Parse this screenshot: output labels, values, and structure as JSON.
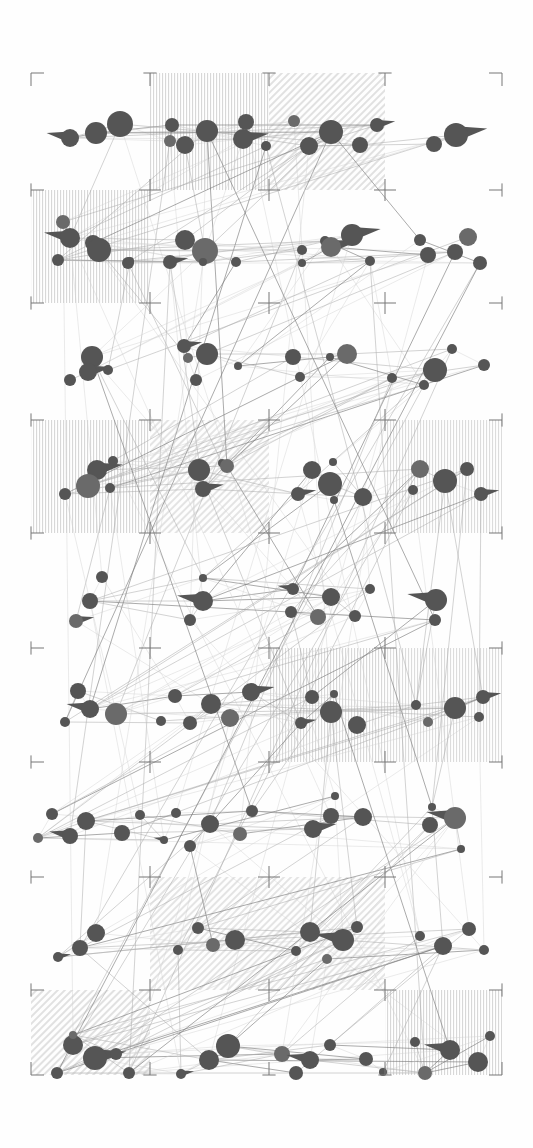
{
  "figure": {
    "kind": "node-link-diagram",
    "width": 533,
    "height": 1148,
    "background_color": "#fefefe"
  },
  "palette": {
    "node_fill": "#555555",
    "node_fill_light": "#6a6a6a",
    "edge_light": "#cfcfcf",
    "edge_mid": "#a8a8a8",
    "edge_dark": "#7a7a7a",
    "hatch_color": "#b9b9b9",
    "registration_color": "#777777",
    "paper": "#fefefe"
  },
  "registration_grid": {
    "label": "registration-marks",
    "columns_x": [
      31,
      150,
      269,
      385,
      502
    ],
    "rows_y": [
      73,
      190,
      303,
      420,
      533,
      648,
      762,
      877,
      990,
      1075
    ],
    "corner_arm_length": 13,
    "plus_arm_length": 11,
    "stroke_width": 1
  },
  "hatch_blocks": [
    {
      "name": "block-r0-c1",
      "x": 150,
      "y": 73,
      "w": 119,
      "h": 117,
      "pattern": "vertical",
      "opacity": 0.55
    },
    {
      "name": "block-r0-c2",
      "x": 269,
      "y": 73,
      "w": 116,
      "h": 117,
      "pattern": "diagonal",
      "opacity": 0.45
    },
    {
      "name": "block-r1-c0",
      "x": 31,
      "y": 190,
      "w": 119,
      "h": 113,
      "pattern": "vertical",
      "opacity": 0.55
    },
    {
      "name": "block-r3-c0",
      "x": 31,
      "y": 420,
      "w": 119,
      "h": 113,
      "pattern": "vertical",
      "opacity": 0.55
    },
    {
      "name": "block-r3-c1",
      "x": 150,
      "y": 420,
      "w": 119,
      "h": 113,
      "pattern": "diagonal",
      "opacity": 0.4
    },
    {
      "name": "block-r3-c3",
      "x": 385,
      "y": 420,
      "w": 117,
      "h": 113,
      "pattern": "vertical",
      "opacity": 0.5
    },
    {
      "name": "block-r5-c2",
      "x": 269,
      "y": 648,
      "w": 116,
      "h": 114,
      "pattern": "vertical",
      "opacity": 0.55
    },
    {
      "name": "block-r5-c3",
      "x": 385,
      "y": 648,
      "w": 117,
      "h": 114,
      "pattern": "vertical",
      "opacity": 0.5
    },
    {
      "name": "block-r7-c1",
      "x": 150,
      "y": 877,
      "w": 119,
      "h": 113,
      "pattern": "diagonal",
      "opacity": 0.4
    },
    {
      "name": "block-r7-c2",
      "x": 269,
      "y": 877,
      "w": 116,
      "h": 113,
      "pattern": "diagonal",
      "opacity": 0.4
    },
    {
      "name": "block-r8-c0",
      "x": 31,
      "y": 990,
      "w": 119,
      "h": 85,
      "pattern": "diagonal",
      "opacity": 0.45
    },
    {
      "name": "block-r8-c3",
      "x": 385,
      "y": 990,
      "w": 117,
      "h": 85,
      "pattern": "vertical",
      "opacity": 0.55
    }
  ],
  "chart_data": {
    "type": "scatter",
    "xlabel": "",
    "ylabel": "",
    "xlim": [
      0,
      533
    ],
    "ylim": [
      0,
      1148
    ],
    "grid": true,
    "legend": "none",
    "node_count": 176,
    "edge_count": 430,
    "bands_y": [
      130,
      248,
      365,
      482,
      598,
      712,
      828,
      938,
      1050
    ],
    "size_range_px": [
      3,
      13
    ],
    "nodes": [
      {
        "x": 70,
        "y": 138,
        "r": 9,
        "tail": true
      },
      {
        "x": 96,
        "y": 133,
        "r": 11,
        "tail": false
      },
      {
        "x": 120,
        "y": 124,
        "r": 13,
        "tail": false
      },
      {
        "x": 170,
        "y": 141,
        "r": 6,
        "tail": false
      },
      {
        "x": 172,
        "y": 125,
        "r": 7,
        "tail": false
      },
      {
        "x": 185,
        "y": 145,
        "r": 9,
        "tail": false
      },
      {
        "x": 207,
        "y": 131,
        "r": 11,
        "tail": false
      },
      {
        "x": 243,
        "y": 139,
        "r": 10,
        "tail": true
      },
      {
        "x": 246,
        "y": 122,
        "r": 8,
        "tail": false
      },
      {
        "x": 266,
        "y": 146,
        "r": 5,
        "tail": false
      },
      {
        "x": 294,
        "y": 121,
        "r": 6,
        "tail": false
      },
      {
        "x": 309,
        "y": 146,
        "r": 9,
        "tail": false
      },
      {
        "x": 331,
        "y": 132,
        "r": 12,
        "tail": false
      },
      {
        "x": 360,
        "y": 145,
        "r": 8,
        "tail": false
      },
      {
        "x": 377,
        "y": 125,
        "r": 7,
        "tail": true
      },
      {
        "x": 434,
        "y": 144,
        "r": 8,
        "tail": false
      },
      {
        "x": 456,
        "y": 135,
        "r": 12,
        "tail": true
      },
      {
        "x": 63,
        "y": 222,
        "r": 7,
        "tail": false
      },
      {
        "x": 70,
        "y": 238,
        "r": 10,
        "tail": true
      },
      {
        "x": 93,
        "y": 243,
        "r": 8,
        "tail": false
      },
      {
        "x": 99,
        "y": 250,
        "r": 12,
        "tail": false
      },
      {
        "x": 58,
        "y": 260,
        "r": 6,
        "tail": false
      },
      {
        "x": 128,
        "y": 263,
        "r": 6,
        "tail": false
      },
      {
        "x": 185,
        "y": 240,
        "r": 10,
        "tail": false
      },
      {
        "x": 205,
        "y": 251,
        "r": 13,
        "tail": false
      },
      {
        "x": 130,
        "y": 261,
        "r": 4,
        "tail": false
      },
      {
        "x": 170,
        "y": 262,
        "r": 7,
        "tail": true
      },
      {
        "x": 203,
        "y": 262,
        "r": 4,
        "tail": false
      },
      {
        "x": 236,
        "y": 262,
        "r": 5,
        "tail": false
      },
      {
        "x": 302,
        "y": 250,
        "r": 5,
        "tail": false
      },
      {
        "x": 325,
        "y": 241,
        "r": 5,
        "tail": false
      },
      {
        "x": 331,
        "y": 247,
        "r": 10,
        "tail": true
      },
      {
        "x": 352,
        "y": 235,
        "r": 11,
        "tail": true
      },
      {
        "x": 302,
        "y": 263,
        "r": 4,
        "tail": false
      },
      {
        "x": 370,
        "y": 261,
        "r": 5,
        "tail": false
      },
      {
        "x": 420,
        "y": 240,
        "r": 6,
        "tail": false
      },
      {
        "x": 428,
        "y": 255,
        "r": 8,
        "tail": false
      },
      {
        "x": 455,
        "y": 252,
        "r": 8,
        "tail": false
      },
      {
        "x": 468,
        "y": 237,
        "r": 9,
        "tail": false
      },
      {
        "x": 480,
        "y": 263,
        "r": 7,
        "tail": false
      },
      {
        "x": 92,
        "y": 357,
        "r": 11,
        "tail": false
      },
      {
        "x": 88,
        "y": 372,
        "r": 9,
        "tail": true
      },
      {
        "x": 70,
        "y": 380,
        "r": 6,
        "tail": false
      },
      {
        "x": 108,
        "y": 370,
        "r": 5,
        "tail": false
      },
      {
        "x": 184,
        "y": 346,
        "r": 7,
        "tail": true
      },
      {
        "x": 188,
        "y": 358,
        "r": 5,
        "tail": false
      },
      {
        "x": 207,
        "y": 354,
        "r": 11,
        "tail": false
      },
      {
        "x": 196,
        "y": 380,
        "r": 6,
        "tail": false
      },
      {
        "x": 238,
        "y": 366,
        "r": 4,
        "tail": false
      },
      {
        "x": 293,
        "y": 357,
        "r": 8,
        "tail": false
      },
      {
        "x": 300,
        "y": 377,
        "r": 5,
        "tail": false
      },
      {
        "x": 330,
        "y": 357,
        "r": 4,
        "tail": false
      },
      {
        "x": 347,
        "y": 354,
        "r": 10,
        "tail": false
      },
      {
        "x": 392,
        "y": 378,
        "r": 5,
        "tail": false
      },
      {
        "x": 435,
        "y": 370,
        "r": 12,
        "tail": false
      },
      {
        "x": 424,
        "y": 385,
        "r": 5,
        "tail": false
      },
      {
        "x": 452,
        "y": 349,
        "r": 5,
        "tail": false
      },
      {
        "x": 484,
        "y": 365,
        "r": 6,
        "tail": false
      },
      {
        "x": 97,
        "y": 470,
        "r": 10,
        "tail": true
      },
      {
        "x": 88,
        "y": 486,
        "r": 12,
        "tail": false
      },
      {
        "x": 65,
        "y": 494,
        "r": 6,
        "tail": false
      },
      {
        "x": 113,
        "y": 461,
        "r": 5,
        "tail": false
      },
      {
        "x": 110,
        "y": 488,
        "r": 5,
        "tail": false
      },
      {
        "x": 199,
        "y": 470,
        "r": 11,
        "tail": false
      },
      {
        "x": 203,
        "y": 489,
        "r": 8,
        "tail": true
      },
      {
        "x": 222,
        "y": 463,
        "r": 4,
        "tail": false
      },
      {
        "x": 227,
        "y": 466,
        "r": 7,
        "tail": false
      },
      {
        "x": 312,
        "y": 470,
        "r": 9,
        "tail": false
      },
      {
        "x": 298,
        "y": 494,
        "r": 7,
        "tail": true
      },
      {
        "x": 333,
        "y": 462,
        "r": 4,
        "tail": false
      },
      {
        "x": 330,
        "y": 484,
        "r": 12,
        "tail": false
      },
      {
        "x": 334,
        "y": 500,
        "r": 4,
        "tail": false
      },
      {
        "x": 363,
        "y": 497,
        "r": 9,
        "tail": false
      },
      {
        "x": 420,
        "y": 469,
        "r": 9,
        "tail": false
      },
      {
        "x": 445,
        "y": 481,
        "r": 12,
        "tail": false
      },
      {
        "x": 413,
        "y": 490,
        "r": 5,
        "tail": false
      },
      {
        "x": 467,
        "y": 469,
        "r": 7,
        "tail": false
      },
      {
        "x": 481,
        "y": 494,
        "r": 7,
        "tail": true
      },
      {
        "x": 102,
        "y": 577,
        "r": 6,
        "tail": false
      },
      {
        "x": 90,
        "y": 601,
        "r": 8,
        "tail": false
      },
      {
        "x": 76,
        "y": 621,
        "r": 7,
        "tail": true
      },
      {
        "x": 203,
        "y": 601,
        "r": 10,
        "tail": true
      },
      {
        "x": 203,
        "y": 578,
        "r": 4,
        "tail": false
      },
      {
        "x": 190,
        "y": 620,
        "r": 6,
        "tail": false
      },
      {
        "x": 293,
        "y": 589,
        "r": 6,
        "tail": true
      },
      {
        "x": 291,
        "y": 612,
        "r": 6,
        "tail": false
      },
      {
        "x": 331,
        "y": 597,
        "r": 9,
        "tail": false
      },
      {
        "x": 318,
        "y": 617,
        "r": 8,
        "tail": false
      },
      {
        "x": 355,
        "y": 616,
        "r": 6,
        "tail": false
      },
      {
        "x": 370,
        "y": 589,
        "r": 5,
        "tail": false
      },
      {
        "x": 436,
        "y": 600,
        "r": 11,
        "tail": true
      },
      {
        "x": 435,
        "y": 620,
        "r": 6,
        "tail": false
      },
      {
        "x": 78,
        "y": 691,
        "r": 8,
        "tail": false
      },
      {
        "x": 90,
        "y": 709,
        "r": 9,
        "tail": true
      },
      {
        "x": 116,
        "y": 714,
        "r": 11,
        "tail": false
      },
      {
        "x": 65,
        "y": 722,
        "r": 5,
        "tail": false
      },
      {
        "x": 175,
        "y": 696,
        "r": 7,
        "tail": false
      },
      {
        "x": 161,
        "y": 721,
        "r": 5,
        "tail": false
      },
      {
        "x": 211,
        "y": 704,
        "r": 10,
        "tail": false
      },
      {
        "x": 190,
        "y": 723,
        "r": 7,
        "tail": false
      },
      {
        "x": 251,
        "y": 692,
        "r": 9,
        "tail": true
      },
      {
        "x": 230,
        "y": 718,
        "r": 9,
        "tail": false
      },
      {
        "x": 312,
        "y": 697,
        "r": 7,
        "tail": false
      },
      {
        "x": 301,
        "y": 723,
        "r": 6,
        "tail": true
      },
      {
        "x": 331,
        "y": 712,
        "r": 11,
        "tail": false
      },
      {
        "x": 334,
        "y": 694,
        "r": 4,
        "tail": false
      },
      {
        "x": 357,
        "y": 725,
        "r": 9,
        "tail": false
      },
      {
        "x": 416,
        "y": 705,
        "r": 5,
        "tail": false
      },
      {
        "x": 428,
        "y": 722,
        "r": 5,
        "tail": false
      },
      {
        "x": 455,
        "y": 708,
        "r": 11,
        "tail": false
      },
      {
        "x": 483,
        "y": 697,
        "r": 7,
        "tail": true
      },
      {
        "x": 479,
        "y": 717,
        "r": 5,
        "tail": false
      },
      {
        "x": 52,
        "y": 814,
        "r": 6,
        "tail": false
      },
      {
        "x": 86,
        "y": 821,
        "r": 9,
        "tail": false
      },
      {
        "x": 70,
        "y": 836,
        "r": 8,
        "tail": true
      },
      {
        "x": 38,
        "y": 838,
        "r": 5,
        "tail": false
      },
      {
        "x": 122,
        "y": 833,
        "r": 8,
        "tail": false
      },
      {
        "x": 140,
        "y": 815,
        "r": 5,
        "tail": false
      },
      {
        "x": 176,
        "y": 813,
        "r": 5,
        "tail": false
      },
      {
        "x": 190,
        "y": 846,
        "r": 6,
        "tail": false
      },
      {
        "x": 164,
        "y": 840,
        "r": 4,
        "tail": true
      },
      {
        "x": 210,
        "y": 824,
        "r": 9,
        "tail": false
      },
      {
        "x": 240,
        "y": 834,
        "r": 7,
        "tail": false
      },
      {
        "x": 252,
        "y": 811,
        "r": 6,
        "tail": false
      },
      {
        "x": 313,
        "y": 829,
        "r": 9,
        "tail": true
      },
      {
        "x": 331,
        "y": 816,
        "r": 8,
        "tail": false
      },
      {
        "x": 363,
        "y": 817,
        "r": 9,
        "tail": false
      },
      {
        "x": 335,
        "y": 796,
        "r": 4,
        "tail": false
      },
      {
        "x": 430,
        "y": 825,
        "r": 8,
        "tail": false
      },
      {
        "x": 455,
        "y": 818,
        "r": 11,
        "tail": true
      },
      {
        "x": 432,
        "y": 807,
        "r": 4,
        "tail": false
      },
      {
        "x": 461,
        "y": 849,
        "r": 4,
        "tail": false
      },
      {
        "x": 96,
        "y": 933,
        "r": 9,
        "tail": false
      },
      {
        "x": 80,
        "y": 948,
        "r": 8,
        "tail": false
      },
      {
        "x": 58,
        "y": 957,
        "r": 5,
        "tail": true
      },
      {
        "x": 198,
        "y": 928,
        "r": 6,
        "tail": false
      },
      {
        "x": 213,
        "y": 945,
        "r": 7,
        "tail": false
      },
      {
        "x": 235,
        "y": 940,
        "r": 10,
        "tail": false
      },
      {
        "x": 178,
        "y": 950,
        "r": 5,
        "tail": false
      },
      {
        "x": 310,
        "y": 932,
        "r": 10,
        "tail": false
      },
      {
        "x": 296,
        "y": 951,
        "r": 5,
        "tail": false
      },
      {
        "x": 343,
        "y": 940,
        "r": 11,
        "tail": true
      },
      {
        "x": 357,
        "y": 927,
        "r": 6,
        "tail": false
      },
      {
        "x": 327,
        "y": 959,
        "r": 5,
        "tail": false
      },
      {
        "x": 420,
        "y": 936,
        "r": 5,
        "tail": false
      },
      {
        "x": 443,
        "y": 946,
        "r": 9,
        "tail": false
      },
      {
        "x": 469,
        "y": 929,
        "r": 7,
        "tail": false
      },
      {
        "x": 484,
        "y": 950,
        "r": 5,
        "tail": false
      },
      {
        "x": 73,
        "y": 1045,
        "r": 10,
        "tail": false
      },
      {
        "x": 95,
        "y": 1058,
        "r": 12,
        "tail": true
      },
      {
        "x": 73,
        "y": 1035,
        "r": 4,
        "tail": false
      },
      {
        "x": 57,
        "y": 1073,
        "r": 6,
        "tail": false
      },
      {
        "x": 116,
        "y": 1054,
        "r": 6,
        "tail": false
      },
      {
        "x": 129,
        "y": 1073,
        "r": 6,
        "tail": false
      },
      {
        "x": 181,
        "y": 1074,
        "r": 5,
        "tail": true
      },
      {
        "x": 209,
        "y": 1060,
        "r": 10,
        "tail": false
      },
      {
        "x": 228,
        "y": 1046,
        "r": 12,
        "tail": false
      },
      {
        "x": 282,
        "y": 1054,
        "r": 8,
        "tail": false
      },
      {
        "x": 296,
        "y": 1073,
        "r": 7,
        "tail": false
      },
      {
        "x": 310,
        "y": 1060,
        "r": 9,
        "tail": true
      },
      {
        "x": 330,
        "y": 1045,
        "r": 6,
        "tail": false
      },
      {
        "x": 366,
        "y": 1059,
        "r": 7,
        "tail": false
      },
      {
        "x": 383,
        "y": 1072,
        "r": 4,
        "tail": false
      },
      {
        "x": 415,
        "y": 1042,
        "r": 5,
        "tail": false
      },
      {
        "x": 425,
        "y": 1073,
        "r": 7,
        "tail": false
      },
      {
        "x": 450,
        "y": 1050,
        "r": 10,
        "tail": true
      },
      {
        "x": 478,
        "y": 1062,
        "r": 10,
        "tail": false
      },
      {
        "x": 490,
        "y": 1036,
        "r": 5,
        "tail": false
      }
    ]
  }
}
